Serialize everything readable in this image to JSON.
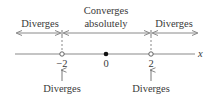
{
  "diagram": {
    "region_labels": {
      "left": "Diverges",
      "middle_line1": "Converges",
      "middle_line2": "absolutely",
      "right": "Diverges"
    },
    "axis": {
      "variable": "x",
      "ticks": [
        {
          "value": -2,
          "label": "−2",
          "marker": "open"
        },
        {
          "value": 0,
          "label": "0",
          "marker": "filled"
        },
        {
          "value": 2,
          "label": "2",
          "marker": "open"
        }
      ]
    },
    "endpoint_labels": {
      "left": "Diverges",
      "right": "Diverges"
    },
    "colors": {
      "line": "#8a8a8a",
      "text": "#3a3a3a",
      "dot": "#111111"
    }
  }
}
